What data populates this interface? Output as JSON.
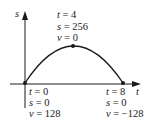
{
  "axes": {
    "y_label": "s",
    "x_label": "t"
  },
  "points": [
    {
      "name": "start",
      "t": "t = 0",
      "s": "s = 0",
      "v": "v = 128"
    },
    {
      "name": "peak",
      "t": "t = 4",
      "s": "s = 256",
      "v": "v = 0"
    },
    {
      "name": "end",
      "t": "t = 8",
      "s": "s = 0",
      "v": "v = −128"
    }
  ],
  "colors": {
    "ink": "#1a1a1a",
    "background": "#ffffff"
  }
}
